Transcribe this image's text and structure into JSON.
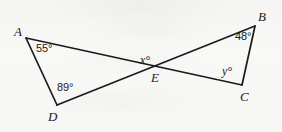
{
  "figure": {
    "background_color": "#f7f7f5",
    "stroke_color": "#1a1a1a",
    "width": 282,
    "height": 132,
    "points": {
      "A": {
        "label": "A",
        "x": 26,
        "y": 38
      },
      "B": {
        "label": "B",
        "x": 255,
        "y": 26
      },
      "C": {
        "label": "C",
        "x": 242,
        "y": 85
      },
      "D": {
        "label": "D",
        "x": 57,
        "y": 105
      },
      "E": {
        "label": "E",
        "x": 148,
        "y": 68
      }
    },
    "vertex_labels": [
      {
        "name": "A",
        "text": "A",
        "x": 14,
        "y": 25
      },
      {
        "name": "B",
        "text": "B",
        "x": 258,
        "y": 10
      },
      {
        "name": "C",
        "text": "C",
        "x": 240,
        "y": 90
      },
      {
        "name": "D",
        "text": "D",
        "x": 48,
        "y": 110
      },
      {
        "name": "E",
        "text": "E",
        "x": 151,
        "y": 71
      }
    ],
    "segments": [
      {
        "name": "segment-AC",
        "from": "A",
        "to": "C"
      },
      {
        "name": "segment-DB",
        "from": "D",
        "to": "B"
      },
      {
        "name": "segment-AD",
        "from": "A",
        "to": "D"
      },
      {
        "name": "segment-BC",
        "from": "B",
        "to": "C"
      }
    ],
    "angle_labels": [
      {
        "name": "angle-at-A",
        "text": "55°",
        "vertex": "A",
        "x": 36,
        "y": 43
      },
      {
        "name": "angle-at-D",
        "text": "89°",
        "vertex": "D",
        "x": 57,
        "y": 82
      },
      {
        "name": "angle-at-B",
        "text": "48°",
        "vertex": "B",
        "x": 235,
        "y": 31
      },
      {
        "name": "angle-at-C",
        "text": "y°",
        "vertex": "C",
        "x": 222,
        "y": 65
      },
      {
        "name": "angle-at-E",
        "text": "x°",
        "vertex": "E",
        "x": 140,
        "y": 54
      }
    ]
  }
}
